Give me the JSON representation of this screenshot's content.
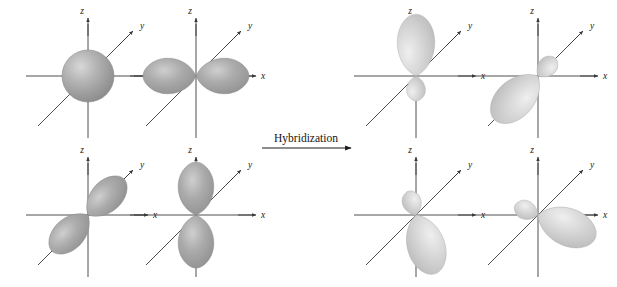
{
  "figure": {
    "background_color": "#ffffff",
    "axis_color": "#3a3a3a",
    "text_color": "#141414",
    "lobe_color_atomic": "#9b9b9b",
    "lobe_color_hybrid": "#c9c9c9",
    "lobe_outline": "#7c7c7c"
  },
  "process": {
    "label": "Hybridization",
    "arrow_icon": "right-arrow-icon",
    "direction": "left-to-right"
  },
  "axes": {
    "z_label": "z",
    "y_label": "y",
    "x_label": "x"
  },
  "panels": [
    {
      "id": "atomic-s",
      "group": "atomic",
      "orbital": "s",
      "shape": "sphere",
      "position": "top-left",
      "cx": 88,
      "cy": 76,
      "labels": {
        "z": "z",
        "y": "y",
        "x": "x"
      }
    },
    {
      "id": "atomic-px",
      "group": "atomic",
      "orbital": "p_x",
      "shape": "two-lobe",
      "axis_direction": "x",
      "position": "top-left-2",
      "cx": 196,
      "cy": 76,
      "labels": {
        "z": "z",
        "y": "y",
        "x": "x"
      }
    },
    {
      "id": "atomic-py",
      "group": "atomic",
      "orbital": "p_y",
      "shape": "two-lobe",
      "axis_direction": "y",
      "position": "bottom-left",
      "cx": 88,
      "cy": 215,
      "labels": {
        "z": "z",
        "y": "y",
        "x": "x"
      }
    },
    {
      "id": "atomic-pz",
      "group": "atomic",
      "orbital": "p_z",
      "shape": "two-lobe",
      "axis_direction": "z",
      "position": "bottom-left-2",
      "cx": 196,
      "cy": 215,
      "labels": {
        "z": "z",
        "y": "y",
        "x": "x"
      }
    },
    {
      "id": "hybrid-1",
      "group": "hybrid",
      "orbital": "sp3",
      "shape": "hybrid-lobe",
      "pointing": "up",
      "position": "top-right-1",
      "cx": 416,
      "cy": 76,
      "labels": {
        "z": "z",
        "y": "y",
        "x": "x"
      }
    },
    {
      "id": "hybrid-2",
      "group": "hybrid",
      "orbital": "sp3",
      "shape": "hybrid-lobe",
      "pointing": "down-left",
      "position": "top-right-2",
      "cx": 538,
      "cy": 76,
      "labels": {
        "z": "z",
        "y": "y",
        "x": "x"
      }
    },
    {
      "id": "hybrid-3",
      "group": "hybrid",
      "orbital": "sp3",
      "shape": "hybrid-lobe",
      "pointing": "down-right",
      "position": "bottom-right-1",
      "cx": 416,
      "cy": 215,
      "labels": {
        "z": "z",
        "y": "y",
        "x": "x"
      }
    },
    {
      "id": "hybrid-4",
      "group": "hybrid",
      "orbital": "sp3",
      "shape": "hybrid-lobe",
      "pointing": "right",
      "position": "bottom-right-2",
      "cx": 538,
      "cy": 215,
      "labels": {
        "z": "z",
        "y": "y",
        "x": "x"
      }
    }
  ]
}
